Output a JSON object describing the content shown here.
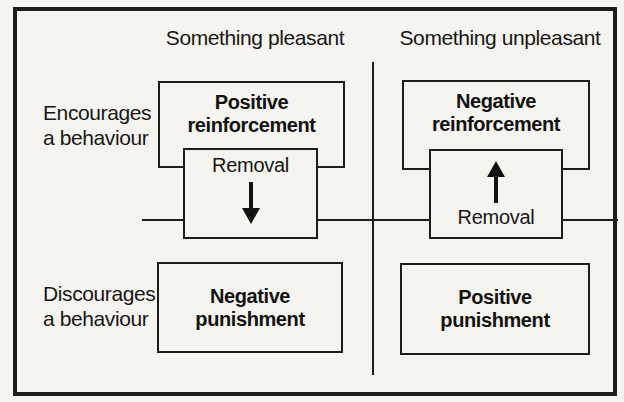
{
  "colors": {
    "paper": "#f6f4ef",
    "line": "#1d1d1b",
    "text": "#171717"
  },
  "columns": [
    {
      "label": "Something pleasant"
    },
    {
      "label": "Something unpleasant"
    }
  ],
  "rows": [
    {
      "label": "Encourages\na behaviour"
    },
    {
      "label": "Discourages\na behaviour"
    }
  ],
  "quadrants": {
    "top_left": {
      "box_label": "Positive\nreinforcement",
      "removal_label": "Removal",
      "arrow_icon": "down-arrow"
    },
    "top_right": {
      "box_label": "Negative\nreinforcement",
      "removal_label": "Removal",
      "arrow_icon": "up-arrow"
    },
    "bottom_left": {
      "box_label": "Negative\npunishment"
    },
    "bottom_right": {
      "box_label": "Positive\npunishment"
    }
  }
}
